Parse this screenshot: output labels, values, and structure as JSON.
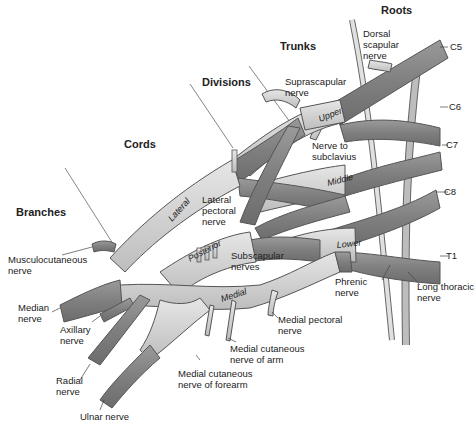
{
  "diagram": {
    "section_headers": {
      "roots": "Roots",
      "trunks": "Trunks",
      "divisions": "Divisions",
      "cords": "Cords",
      "branches": "Branches"
    },
    "roots": [
      "C5",
      "C6",
      "C7",
      "C8",
      "T1"
    ],
    "trunks": [
      "Upper",
      "Middle",
      "Lower"
    ],
    "cords": [
      "Lateral",
      "Posterior",
      "Medial"
    ],
    "nerve_labels": {
      "dorsal_scapular": "Dorsal\nscapular\nnerve",
      "suprascapular": "Suprascapular\nnerve",
      "nerve_to_subclavius": "Nerve to\nsubclavius",
      "lateral_pectoral": "Lateral\npectoral\nnerve",
      "subscapular": "Subscapular\nnerves",
      "musculocutaneous": "Musculocutaneous\nnerve",
      "median": "Median\nnerve",
      "axillary": "Axillary\nnerve",
      "radial": "Radial\nnerve",
      "ulnar": "Ulnar nerve",
      "medial_cutaneous_forearm": "Medial cutaneous\nnerve of forearm",
      "medial_cutaneous_arm": "Medial cutaneous\nnerve of arm",
      "medial_pectoral": "Medial pectoral\nnerve",
      "phrenic": "Phrenic\nnerve",
      "long_thoracic": "Long thoracic\nnerve"
    },
    "colors": {
      "nerve_dark": "#8a8a8a",
      "nerve_light": "#d6d6d6",
      "outline": "#555555",
      "text": "#222222"
    }
  }
}
